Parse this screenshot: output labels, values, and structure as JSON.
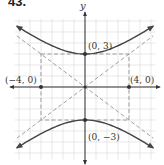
{
  "problem": {
    "number": "43."
  },
  "graph": {
    "axis_labels": {
      "y": "y"
    },
    "points": [
      {
        "label": "(0, 3)",
        "x": 0,
        "y": 3
      },
      {
        "label": "(0, −3)",
        "x": 0,
        "y": -3
      },
      {
        "label": "(−4, 0)",
        "x": -4,
        "y": 0
      },
      {
        "label": "(4, 0)",
        "x": 4,
        "y": 0
      }
    ],
    "colors": {
      "grid": "#d9d9d9",
      "axes": "#333333",
      "curve": "#444444",
      "dashed": "#888888"
    }
  },
  "chart_data": {
    "type": "line",
    "title": "",
    "equation": "y^2/9 - x^2/16 = 1",
    "vertices": [
      [
        0,
        3
      ],
      [
        0,
        -3
      ]
    ],
    "co_vertices": [
      [
        -4,
        0
      ],
      [
        4,
        0
      ]
    ],
    "asymptotes": [
      "y = 3/4 x",
      "y = -3/4 x"
    ],
    "xlim": [
      -6,
      6
    ],
    "ylim": [
      -6,
      6
    ],
    "grid": true
  }
}
